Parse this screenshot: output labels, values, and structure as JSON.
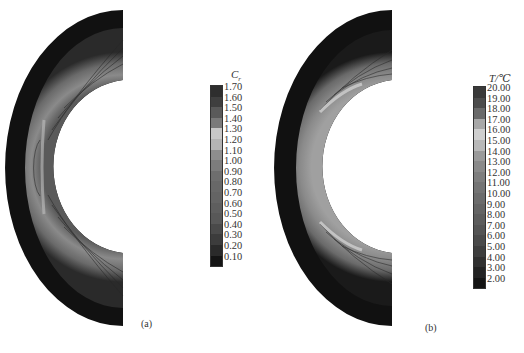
{
  "figure": {
    "panels": [
      {
        "id": "a",
        "label": "(a)",
        "legend": {
          "title_main": "C",
          "title_sub": "r",
          "levels": [
            "1.70",
            "1.60",
            "1.50",
            "1.40",
            "1.30",
            "1.20",
            "1.10",
            "1.00",
            "0.90",
            "0.80",
            "0.70",
            "0.60",
            "0.50",
            "0.40",
            "0.30",
            "0.20",
            "0.10"
          ],
          "colors": [
            "#2e2e2e",
            "#3f3f3f",
            "#5a5a5a",
            "#7a7a7a",
            "#c8c8c8",
            "#b4b4b4",
            "#8e8e8e",
            "#7c7c7c",
            "#6e6e6e",
            "#686868",
            "#646464",
            "#5e5e5e",
            "#585858",
            "#4a4a4a",
            "#3c3c3c",
            "#2a2a2a",
            "#141414"
          ]
        }
      },
      {
        "id": "b",
        "label": "(b)",
        "legend": {
          "title_main": "T/℃",
          "title_sub": "",
          "levels": [
            "20.00",
            "19.00",
            "18.00",
            "17.00",
            "16.00",
            "15.00",
            "14.00",
            "13.00",
            "12.00",
            "11.00",
            "10.00",
            "9.00",
            "8.00",
            "7.00",
            "6.00",
            "5.00",
            "4.00",
            "3.00",
            "2.00"
          ],
          "colors": [
            "#3a3a3a",
            "#4c4c4c",
            "#6a6a6a",
            "#a8a8a8",
            "#cfcfcf",
            "#b8b8b8",
            "#9a9a9a",
            "#8a8a8a",
            "#7e7e7e",
            "#747474",
            "#6c6c6c",
            "#646464",
            "#5c5c5c",
            "#545454",
            "#4a4a4a",
            "#3e3e3e",
            "#303030",
            "#222222",
            "#141414"
          ]
        }
      }
    ]
  },
  "chart_data": [
    {
      "type": "heatmap",
      "title": "",
      "subplot": "(a)",
      "description": "Contour plot of Cr over a half-annulus (bow) domain",
      "colorbar_title": "Cr",
      "colorbar_ticks": [
        1.7,
        1.6,
        1.5,
        1.4,
        1.3,
        1.2,
        1.1,
        1.0,
        0.9,
        0.8,
        0.7,
        0.6,
        0.5,
        0.4,
        0.3,
        0.2,
        0.1
      ],
      "colorbar_range": [
        0.1,
        1.7
      ]
    },
    {
      "type": "heatmap",
      "title": "",
      "subplot": "(b)",
      "description": "Contour plot of temperature T over a half-annulus (bow) domain",
      "colorbar_title": "T/℃",
      "colorbar_ticks": [
        20.0,
        19.0,
        18.0,
        17.0,
        16.0,
        15.0,
        14.0,
        13.0,
        12.0,
        11.0,
        10.0,
        9.0,
        8.0,
        7.0,
        6.0,
        5.0,
        4.0,
        3.0,
        2.0
      ],
      "colorbar_range": [
        2.0,
        20.0
      ]
    }
  ]
}
